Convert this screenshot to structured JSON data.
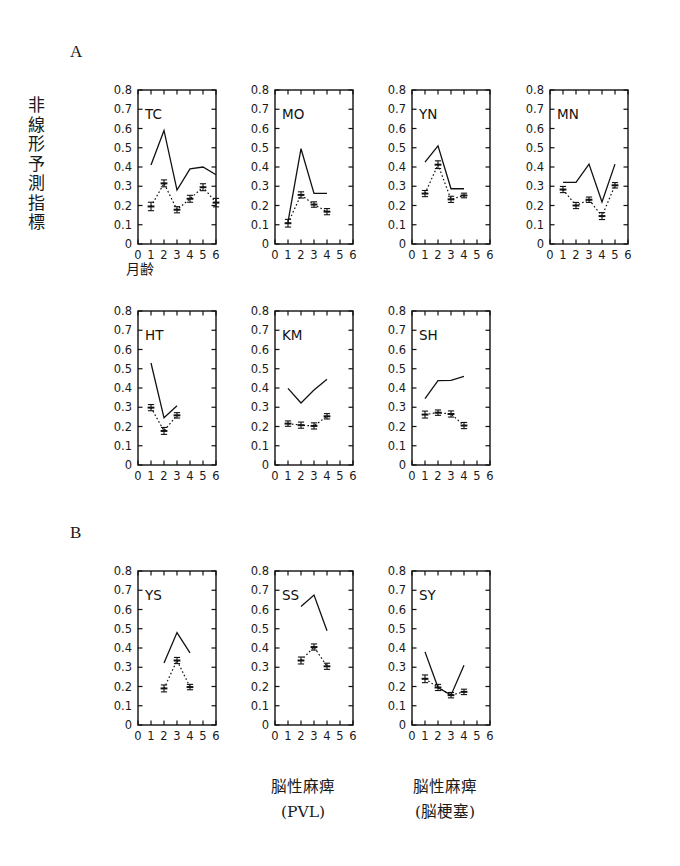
{
  "figure": {
    "section_a_label": "A",
    "section_b_label": "B",
    "y_axis_label": "非線形予測指標",
    "y_axis_label_chars": [
      "非",
      "線",
      "形",
      "予",
      "測",
      "指",
      "標"
    ],
    "x_axis_label": "月齢",
    "caption_pvl_line1": "脳性麻痺",
    "caption_pvl_line2": "(PVL)",
    "caption_infarct_line1": "脳性麻痺",
    "caption_infarct_line2": "(脳梗塞)",
    "axis_color": "#111111",
    "line_color": "#111111",
    "background": "#ffffff"
  },
  "chart_data": [
    {
      "type": "line",
      "title": "TC",
      "section": "A",
      "xlabel": "月齢",
      "ylabel": "非線形予測指標",
      "xlim": [
        0,
        6
      ],
      "ylim": [
        0,
        0.8
      ],
      "xticks": [
        0,
        1,
        2,
        3,
        4,
        5,
        6
      ],
      "yticks": [
        0,
        0.1,
        0.2,
        0.3,
        0.4,
        0.5,
        0.6,
        0.7,
        0.8
      ],
      "ytick_labels": [
        "0",
        "0.1",
        "0.2",
        "0.3",
        "0.4",
        "0.5",
        "0.6",
        "0.7",
        "0.8"
      ],
      "grid": false,
      "legend": "none",
      "x": [
        1,
        2,
        3,
        4,
        5,
        6
      ],
      "series": [
        {
          "name": "solid",
          "style": "solid",
          "markers": false,
          "values": [
            0.41,
            0.59,
            0.28,
            0.39,
            0.4,
            0.36
          ]
        },
        {
          "name": "dotted",
          "style": "dotted",
          "markers": true,
          "values": [
            0.195,
            0.315,
            0.178,
            0.235,
            0.295,
            0.215
          ],
          "errors": [
            0.022,
            0.018,
            0.016,
            0.018,
            0.018,
            0.022
          ]
        }
      ]
    },
    {
      "type": "line",
      "title": "MO",
      "section": "A",
      "xlim": [
        0,
        6
      ],
      "ylim": [
        0,
        0.8
      ],
      "xticks": [
        0,
        1,
        2,
        3,
        4,
        5,
        6
      ],
      "yticks": [
        0,
        0.1,
        0.2,
        0.3,
        0.4,
        0.5,
        0.6,
        0.7,
        0.8
      ],
      "ytick_labels": [
        "0",
        "0.1",
        "0.2",
        "0.3",
        "0.4",
        "0.5",
        "0.6",
        "0.7",
        "0.8"
      ],
      "grid": false,
      "x": [
        1,
        2,
        3,
        4
      ],
      "series": [
        {
          "name": "solid",
          "style": "solid",
          "markers": false,
          "values": [
            0.115,
            0.495,
            0.263,
            0.263
          ]
        },
        {
          "name": "dotted",
          "style": "dotted",
          "markers": true,
          "values": [
            0.108,
            0.255,
            0.205,
            0.168
          ],
          "errors": [
            0.02,
            0.016,
            0.014,
            0.016
          ]
        }
      ]
    },
    {
      "type": "line",
      "title": "YN",
      "section": "A",
      "xlim": [
        0,
        6
      ],
      "ylim": [
        0,
        0.8
      ],
      "xticks": [
        0,
        1,
        2,
        3,
        4,
        5,
        6
      ],
      "yticks": [
        0,
        0.1,
        0.2,
        0.3,
        0.4,
        0.5,
        0.6,
        0.7,
        0.8
      ],
      "ytick_labels": [
        "0",
        "0.1",
        "0.2",
        "0.3",
        "0.4",
        "0.5",
        "0.6",
        "0.7",
        "0.8"
      ],
      "grid": false,
      "x": [
        1,
        2,
        3,
        4
      ],
      "series": [
        {
          "name": "solid",
          "style": "solid",
          "markers": false,
          "values": [
            0.425,
            0.51,
            0.287,
            0.287
          ]
        },
        {
          "name": "dotted",
          "style": "dotted",
          "markers": true,
          "values": [
            0.262,
            0.412,
            0.232,
            0.252
          ],
          "errors": [
            0.016,
            0.02,
            0.016,
            0.012
          ]
        }
      ]
    },
    {
      "type": "line",
      "title": "MN",
      "section": "A",
      "xlim": [
        0,
        6
      ],
      "ylim": [
        0,
        0.8
      ],
      "xticks": [
        0,
        1,
        2,
        3,
        4,
        5,
        6
      ],
      "yticks": [
        0,
        0.1,
        0.2,
        0.3,
        0.4,
        0.5,
        0.6,
        0.7,
        0.8
      ],
      "ytick_labels": [
        "0",
        "0.1",
        "0.2",
        "0.3",
        "0.4",
        "0.5",
        "0.6",
        "0.7",
        "0.8"
      ],
      "grid": false,
      "x": [
        1,
        2,
        3,
        4,
        5
      ],
      "series": [
        {
          "name": "solid",
          "style": "solid",
          "markers": false,
          "values": [
            0.32,
            0.32,
            0.415,
            0.218,
            0.415
          ]
        },
        {
          "name": "dotted",
          "style": "dotted",
          "markers": true,
          "values": [
            0.283,
            0.2,
            0.23,
            0.145,
            0.305
          ],
          "errors": [
            0.016,
            0.016,
            0.014,
            0.018,
            0.014
          ]
        }
      ]
    },
    {
      "type": "line",
      "title": "HT",
      "section": "A",
      "xlim": [
        0,
        6
      ],
      "ylim": [
        0,
        0.8
      ],
      "xticks": [
        0,
        1,
        2,
        3,
        4,
        5,
        6
      ],
      "yticks": [
        0,
        0.1,
        0.2,
        0.3,
        0.4,
        0.5,
        0.6,
        0.7,
        0.8
      ],
      "ytick_labels": [
        "0",
        "0.1",
        "0.2",
        "0.3",
        "0.4",
        "0.5",
        "0.6",
        "0.7",
        "0.8"
      ],
      "grid": false,
      "x": [
        1,
        2,
        3
      ],
      "series": [
        {
          "name": "solid",
          "style": "solid",
          "markers": false,
          "values": [
            0.53,
            0.245,
            0.308
          ]
        },
        {
          "name": "dotted",
          "style": "dotted",
          "markers": true,
          "values": [
            0.298,
            0.177,
            0.258
          ],
          "errors": [
            0.016,
            0.018,
            0.014
          ]
        }
      ]
    },
    {
      "type": "line",
      "title": "KM",
      "section": "A",
      "xlim": [
        0,
        6
      ],
      "ylim": [
        0,
        0.8
      ],
      "xticks": [
        0,
        1,
        2,
        3,
        4,
        5,
        6
      ],
      "yticks": [
        0,
        0.1,
        0.2,
        0.3,
        0.4,
        0.5,
        0.6,
        0.7,
        0.8
      ],
      "ytick_labels": [
        "0",
        "0.1",
        "0.2",
        "0.3",
        "0.4",
        "0.5",
        "0.6",
        "0.7",
        "0.8"
      ],
      "grid": false,
      "x": [
        1,
        2,
        3,
        4
      ],
      "series": [
        {
          "name": "solid",
          "style": "solid",
          "markers": false,
          "values": [
            0.398,
            0.322,
            0.39,
            0.445
          ]
        },
        {
          "name": "dotted",
          "style": "dotted",
          "markers": true,
          "values": [
            0.215,
            0.207,
            0.203,
            0.253
          ],
          "errors": [
            0.014,
            0.016,
            0.016,
            0.014
          ]
        }
      ]
    },
    {
      "type": "line",
      "title": "SH",
      "section": "A",
      "xlim": [
        0,
        6
      ],
      "ylim": [
        0,
        0.8
      ],
      "xticks": [
        0,
        1,
        2,
        3,
        4,
        5,
        6
      ],
      "yticks": [
        0,
        0.1,
        0.2,
        0.3,
        0.4,
        0.5,
        0.6,
        0.7,
        0.8
      ],
      "ytick_labels": [
        "0",
        "0.1",
        "0.2",
        "0.3",
        "0.4",
        "0.5",
        "0.6",
        "0.7",
        "0.8"
      ],
      "grid": false,
      "x": [
        1,
        2,
        3,
        4
      ],
      "series": [
        {
          "name": "solid",
          "style": "solid",
          "markers": false,
          "values": [
            0.345,
            0.438,
            0.44,
            0.46
          ]
        },
        {
          "name": "dotted",
          "style": "dotted",
          "markers": true,
          "values": [
            0.262,
            0.272,
            0.265,
            0.205
          ],
          "errors": [
            0.018,
            0.014,
            0.016,
            0.016
          ]
        }
      ]
    },
    {
      "type": "line",
      "title": "YS",
      "section": "B",
      "xlim": [
        0,
        6
      ],
      "ylim": [
        0,
        0.8
      ],
      "xticks": [
        0,
        1,
        2,
        3,
        4,
        5,
        6
      ],
      "yticks": [
        0,
        0.1,
        0.2,
        0.3,
        0.4,
        0.5,
        0.6,
        0.7,
        0.8
      ],
      "ytick_labels": [
        "0",
        "0.1",
        "0.2",
        "0.3",
        "0.4",
        "0.5",
        "0.6",
        "0.7",
        "0.8"
      ],
      "grid": false,
      "x": [
        2,
        3,
        4
      ],
      "series": [
        {
          "name": "solid",
          "style": "solid",
          "markers": false,
          "values": [
            0.322,
            0.48,
            0.375
          ]
        },
        {
          "name": "dotted",
          "style": "dotted",
          "markers": true,
          "values": [
            0.19,
            0.335,
            0.197
          ],
          "errors": [
            0.018,
            0.016,
            0.014
          ]
        }
      ]
    },
    {
      "type": "line",
      "title": "SS",
      "section": "B",
      "caption": "脳性麻痺 (PVL)",
      "xlim": [
        0,
        6
      ],
      "ylim": [
        0,
        0.8
      ],
      "xticks": [
        0,
        1,
        2,
        3,
        4,
        5,
        6
      ],
      "yticks": [
        0,
        0.1,
        0.2,
        0.3,
        0.4,
        0.5,
        0.6,
        0.7,
        0.8
      ],
      "ytick_labels": [
        "0",
        "0.1",
        "0.2",
        "0.3",
        "0.4",
        "0.5",
        "0.6",
        "0.7",
        "0.8"
      ],
      "grid": false,
      "x": [
        2,
        3,
        4
      ],
      "series": [
        {
          "name": "solid",
          "style": "solid",
          "markers": false,
          "values": [
            0.615,
            0.675,
            0.49
          ]
        },
        {
          "name": "dotted",
          "style": "dotted",
          "markers": true,
          "values": [
            0.335,
            0.405,
            0.305
          ],
          "errors": [
            0.018,
            0.016,
            0.016
          ]
        }
      ]
    },
    {
      "type": "line",
      "title": "SY",
      "section": "B",
      "caption": "脳性麻痺 (脳梗塞)",
      "xlim": [
        0,
        6
      ],
      "ylim": [
        0,
        0.8
      ],
      "xticks": [
        0,
        1,
        2,
        3,
        4,
        5,
        6
      ],
      "yticks": [
        0,
        0.1,
        0.2,
        0.3,
        0.4,
        0.5,
        0.6,
        0.7,
        0.8
      ],
      "ytick_labels": [
        "0",
        "0.1",
        "0.2",
        "0.3",
        "0.4",
        "0.5",
        "0.6",
        "0.7",
        "0.8"
      ],
      "grid": false,
      "x": [
        1,
        2,
        3,
        4
      ],
      "series": [
        {
          "name": "solid",
          "style": "solid",
          "markers": false,
          "values": [
            0.38,
            0.195,
            0.155,
            0.31
          ]
        },
        {
          "name": "dotted",
          "style": "dotted",
          "markers": true,
          "values": [
            0.24,
            0.195,
            0.155,
            0.172
          ],
          "errors": [
            0.02,
            0.016,
            0.014,
            0.014
          ]
        }
      ]
    }
  ],
  "layout": {
    "panels": [
      {
        "id": "TC",
        "left": 96,
        "top": 84,
        "show_y_ticklabels": true
      },
      {
        "id": "MO",
        "left": 233,
        "top": 84,
        "show_y_ticklabels": true
      },
      {
        "id": "YN",
        "left": 370,
        "top": 84,
        "show_y_ticklabels": true
      },
      {
        "id": "MN",
        "left": 508,
        "top": 84,
        "show_y_ticklabels": true
      },
      {
        "id": "HT",
        "left": 96,
        "top": 305,
        "show_y_ticklabels": true
      },
      {
        "id": "KM",
        "left": 233,
        "top": 305,
        "show_y_ticklabels": true
      },
      {
        "id": "SH",
        "left": 370,
        "top": 305,
        "show_y_ticklabels": true
      },
      {
        "id": "YS",
        "left": 96,
        "top": 565,
        "show_y_ticklabels": true
      },
      {
        "id": "SS",
        "left": 233,
        "top": 565,
        "show_y_ticklabels": true
      },
      {
        "id": "SY",
        "left": 370,
        "top": 565,
        "show_y_ticklabels": true
      }
    ]
  }
}
